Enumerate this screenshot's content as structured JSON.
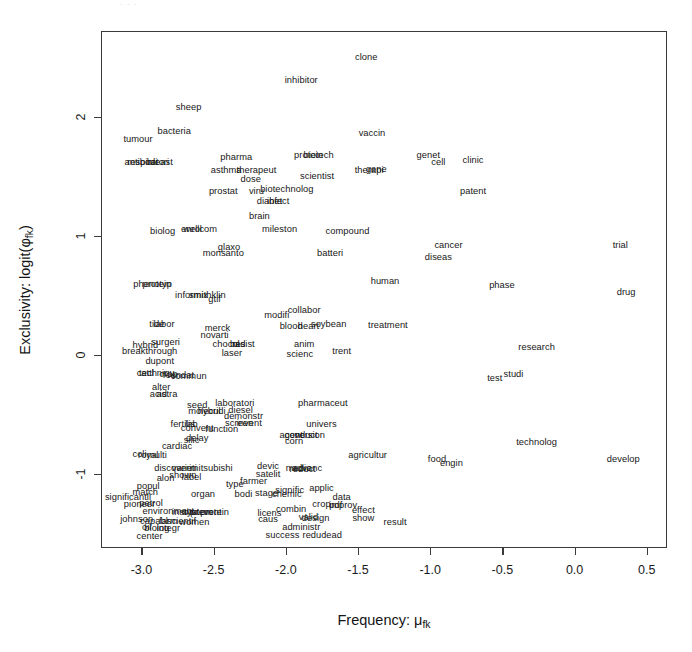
{
  "figure": {
    "top_artifact_text": "· ·                                                    ·"
  },
  "chart_data": {
    "type": "scatter",
    "title": "",
    "subtitle": "",
    "xlabel": "Frequency: μ_fk",
    "ylabel": "Exclusivity: logit(φ_fk)",
    "xlabel_parts": {
      "text": "Frequency: μ",
      "sub": "fk"
    },
    "ylabel_parts": {
      "pre": "Exclusivity: logit(φ",
      "sub": "fk",
      "post": ")"
    },
    "grid": false,
    "legend": null,
    "xlim": [
      -3.28,
      0.64
    ],
    "ylim": [
      -1.62,
      2.72
    ],
    "xticks": [
      -3.0,
      -2.5,
      -2.0,
      -1.5,
      -1.0,
      -0.5,
      0.0,
      0.5
    ],
    "xticklabels": [
      "-3.0",
      "-2.5",
      "-2.0",
      "-1.5",
      "-1.0",
      "-0.5",
      "0.0",
      "0.5"
    ],
    "yticks": [
      -1,
      0,
      1,
      2
    ],
    "yticklabels": [
      "-1",
      "0",
      "1",
      "2"
    ],
    "marker": "text-label",
    "note": "Each data point is rendered as its word label (STM topic word plot).",
    "points": [
      {
        "label": "clone",
        "x": -1.45,
        "y": 2.5
      },
      {
        "label": "inhibitor",
        "x": -1.9,
        "y": 2.31
      },
      {
        "label": "sheep",
        "x": -2.68,
        "y": 2.08
      },
      {
        "label": "bacteria",
        "x": -2.78,
        "y": 1.88
      },
      {
        "label": "tumour",
        "x": -3.03,
        "y": 1.81
      },
      {
        "label": "vaccin",
        "x": -1.41,
        "y": 1.86
      },
      {
        "label": "antibodi",
        "x": -3.01,
        "y": 1.62
      },
      {
        "label": "respiratori",
        "x": -2.96,
        "y": 1.62
      },
      {
        "label": "breast",
        "x": -2.88,
        "y": 1.62
      },
      {
        "label": "pharma",
        "x": -2.35,
        "y": 1.66
      },
      {
        "label": "protein",
        "x": -1.85,
        "y": 1.68
      },
      {
        "label": "biotech",
        "x": -1.78,
        "y": 1.68
      },
      {
        "label": "asthma",
        "x": -2.42,
        "y": 1.55
      },
      {
        "label": "therapeut",
        "x": -2.21,
        "y": 1.55
      },
      {
        "label": "therapi",
        "x": -1.43,
        "y": 1.55
      },
      {
        "label": "gene",
        "x": -1.38,
        "y": 1.56
      },
      {
        "label": "genet",
        "x": -1.02,
        "y": 1.68
      },
      {
        "label": "cell",
        "x": -0.95,
        "y": 1.62
      },
      {
        "label": "clinic",
        "x": -0.71,
        "y": 1.64
      },
      {
        "label": "dose",
        "x": -2.25,
        "y": 1.48
      },
      {
        "label": "scientist",
        "x": -1.79,
        "y": 1.5
      },
      {
        "label": "prostat",
        "x": -2.44,
        "y": 1.38
      },
      {
        "label": "viru",
        "x": -2.21,
        "y": 1.38
      },
      {
        "label": "biotechnolog",
        "x": -2.0,
        "y": 1.39
      },
      {
        "label": "patent",
        "x": -0.71,
        "y": 1.38
      },
      {
        "label": "diabet",
        "x": -2.12,
        "y": 1.29
      },
      {
        "label": "infect",
        "x": -2.06,
        "y": 1.29
      },
      {
        "label": "brain",
        "x": -2.19,
        "y": 1.17
      },
      {
        "label": "biolog",
        "x": -2.86,
        "y": 1.04
      },
      {
        "label": "enrol",
        "x": -2.66,
        "y": 1.06
      },
      {
        "label": "wellcom",
        "x": -2.6,
        "y": 1.06
      },
      {
        "label": "mileston",
        "x": -2.05,
        "y": 1.06
      },
      {
        "label": "compound",
        "x": -1.58,
        "y": 1.04
      },
      {
        "label": "cancer",
        "x": -0.88,
        "y": 0.92
      },
      {
        "label": "trial",
        "x": 0.31,
        "y": 0.92
      },
      {
        "label": "glaxo",
        "x": -2.4,
        "y": 0.91
      },
      {
        "label": "monsanto",
        "x": -2.44,
        "y": 0.86
      },
      {
        "label": "batteri",
        "x": -1.7,
        "y": 0.86
      },
      {
        "label": "diseas",
        "x": -0.95,
        "y": 0.82
      },
      {
        "label": "phenotyp",
        "x": -2.93,
        "y": 0.6
      },
      {
        "label": "protein2",
        "x": -2.9,
        "y": 0.6,
        "display": "protein"
      },
      {
        "label": "human",
        "x": -1.32,
        "y": 0.62
      },
      {
        "label": "phase",
        "x": -0.51,
        "y": 0.59
      },
      {
        "label": "drug",
        "x": 0.35,
        "y": 0.53
      },
      {
        "label": "informix",
        "x": -2.66,
        "y": 0.5
      },
      {
        "label": "smithklin",
        "x": -2.55,
        "y": 0.5
      },
      {
        "label": "gtif",
        "x": -2.5,
        "y": 0.47
      },
      {
        "label": "modifi",
        "x": -2.07,
        "y": 0.34
      },
      {
        "label": "collabor",
        "x": -1.88,
        "y": 0.38
      },
      {
        "label": "tide",
        "x": -2.9,
        "y": 0.26
      },
      {
        "label": "labor",
        "x": -2.85,
        "y": 0.26
      },
      {
        "label": "merck",
        "x": -2.48,
        "y": 0.23
      },
      {
        "label": "blood",
        "x": -1.97,
        "y": 0.24
      },
      {
        "label": "heart",
        "x": -1.85,
        "y": 0.24
      },
      {
        "label": "soybean",
        "x": -1.71,
        "y": 0.26
      },
      {
        "label": "treatment",
        "x": -1.3,
        "y": 0.25
      },
      {
        "label": "novarti",
        "x": -2.5,
        "y": 0.17
      },
      {
        "label": "hybrid",
        "x": -2.98,
        "y": 0.08
      },
      {
        "label": "surgeri",
        "x": -2.84,
        "y": 0.11
      },
      {
        "label": "chocol",
        "x": -2.42,
        "y": 0.09
      },
      {
        "label": "bad",
        "x": -2.34,
        "y": 0.09
      },
      {
        "label": "resist",
        "x": -2.3,
        "y": 0.09
      },
      {
        "label": "anim",
        "x": -1.88,
        "y": 0.09
      },
      {
        "label": "research",
        "x": -0.27,
        "y": 0.07
      },
      {
        "label": "breakthrough",
        "x": -2.95,
        "y": 0.03
      },
      {
        "label": "laser",
        "x": -2.38,
        "y": 0.02
      },
      {
        "label": "scienc",
        "x": -1.91,
        "y": 0.01
      },
      {
        "label": "trent",
        "x": -1.62,
        "y": 0.03
      },
      {
        "label": "dupont",
        "x": -2.88,
        "y": -0.05
      },
      {
        "label": "cattl",
        "x": -2.98,
        "y": -0.15
      },
      {
        "label": "techniqu",
        "x": -2.9,
        "y": -0.15
      },
      {
        "label": "crop2",
        "x": -2.82,
        "y": -0.16,
        "display": "crop"
      },
      {
        "label": "foundat",
        "x": -2.75,
        "y": -0.17
      },
      {
        "label": "commun",
        "x": -2.68,
        "y": -0.18
      },
      {
        "label": "test",
        "x": -0.56,
        "y": -0.19
      },
      {
        "label": "studi",
        "x": -0.43,
        "y": -0.16
      },
      {
        "label": "alter",
        "x": -2.87,
        "y": -0.27
      },
      {
        "label": "acid",
        "x": -2.89,
        "y": -0.33
      },
      {
        "label": "astra",
        "x": -2.83,
        "y": -0.33
      },
      {
        "label": "seed",
        "x": -2.62,
        "y": -0.42
      },
      {
        "label": "laboratori",
        "x": -2.36,
        "y": -0.4
      },
      {
        "label": "pharmaceut",
        "x": -1.75,
        "y": -0.4
      },
      {
        "label": "molecul",
        "x": -2.57,
        "y": -0.47
      },
      {
        "label": "hybridi",
        "x": -2.52,
        "y": -0.47
      },
      {
        "label": "diesel",
        "x": -2.32,
        "y": -0.46
      },
      {
        "label": "demonstr",
        "x": -2.3,
        "y": -0.51
      },
      {
        "label": "fertilis",
        "x": -2.72,
        "y": -0.58
      },
      {
        "label": "lab",
        "x": -2.66,
        "y": -0.58
      },
      {
        "label": "convent",
        "x": -2.62,
        "y": -0.61
      },
      {
        "label": "screen",
        "x": -2.33,
        "y": -0.57
      },
      {
        "label": "invent",
        "x": -2.26,
        "y": -0.57
      },
      {
        "label": "univers",
        "x": -1.76,
        "y": -0.58
      },
      {
        "label": "function",
        "x": -2.45,
        "y": -0.62
      },
      {
        "label": "agent",
        "x": -1.97,
        "y": -0.67
      },
      {
        "label": "conduct",
        "x": -1.9,
        "y": -0.67
      },
      {
        "label": "version",
        "x": -1.84,
        "y": -0.67
      },
      {
        "label": "delay",
        "x": -2.62,
        "y": -0.7
      },
      {
        "label": "silic",
        "x": -2.66,
        "y": -0.71
      },
      {
        "label": "cardiac",
        "x": -2.76,
        "y": -0.76
      },
      {
        "label": "corn",
        "x": -1.95,
        "y": -0.72
      },
      {
        "label": "technolog",
        "x": -0.27,
        "y": -0.73
      },
      {
        "label": "coli",
        "x": -3.02,
        "y": -0.83
      },
      {
        "label": "royal",
        "x": -2.96,
        "y": -0.84
      },
      {
        "label": "multi",
        "x": -2.9,
        "y": -0.84
      },
      {
        "label": "agricultur",
        "x": -1.44,
        "y": -0.84
      },
      {
        "label": "food",
        "x": -0.96,
        "y": -0.87
      },
      {
        "label": "engin",
        "x": -0.86,
        "y": -0.91
      },
      {
        "label": "develop",
        "x": 0.33,
        "y": -0.87
      },
      {
        "label": "discoveri",
        "x": -2.79,
        "y": -0.95
      },
      {
        "label": "varieti",
        "x": -2.71,
        "y": -0.95
      },
      {
        "label": "mitsubishi",
        "x": -2.52,
        "y": -0.95
      },
      {
        "label": "devic",
        "x": -2.13,
        "y": -0.93
      },
      {
        "label": "medic",
        "x": -1.92,
        "y": -0.95
      },
      {
        "label": "advanc",
        "x": -1.86,
        "y": -0.95
      },
      {
        "label": "reduct",
        "x": -1.89,
        "y": -0.96
      },
      {
        "label": "shown",
        "x": -2.72,
        "y": -1.01
      },
      {
        "label": "label",
        "x": -2.66,
        "y": -1.02
      },
      {
        "label": "satelit",
        "x": -2.13,
        "y": -1.0
      },
      {
        "label": "alon",
        "x": -2.84,
        "y": -1.03
      },
      {
        "label": "farmer",
        "x": -2.23,
        "y": -1.06
      },
      {
        "label": "popul",
        "x": -2.96,
        "y": -1.1
      },
      {
        "label": "type",
        "x": -2.36,
        "y": -1.08
      },
      {
        "label": "match",
        "x": -2.98,
        "y": -1.15
      },
      {
        "label": "organ",
        "x": -2.58,
        "y": -1.17
      },
      {
        "label": "bodi",
        "x": -2.3,
        "y": -1.17
      },
      {
        "label": "stage",
        "x": -2.14,
        "y": -1.16
      },
      {
        "label": "signific",
        "x": -1.98,
        "y": -1.13
      },
      {
        "label": "applic",
        "x": -1.76,
        "y": -1.12
      },
      {
        "label": "chemic",
        "x": -2.0,
        "y": -1.17
      },
      {
        "label": "significantli",
        "x": -3.1,
        "y": -1.19
      },
      {
        "label": "data",
        "x": -1.62,
        "y": -1.19
      },
      {
        "label": "pioneer",
        "x": -3.02,
        "y": -1.25
      },
      {
        "label": "petrol",
        "x": -2.94,
        "y": -1.24
      },
      {
        "label": "crop",
        "x": -1.76,
        "y": -1.25
      },
      {
        "label": "pdf",
        "x": -1.66,
        "y": -1.26
      },
      {
        "label": "improv2",
        "x": -1.61,
        "y": -1.26,
        "display": "improv"
      },
      {
        "label": "environment",
        "x": -2.82,
        "y": -1.31
      },
      {
        "label": "institut",
        "x": -2.7,
        "y": -1.32
      },
      {
        "label": "system",
        "x": -2.62,
        "y": -1.32
      },
      {
        "label": "prevent",
        "x": -2.56,
        "y": -1.32
      },
      {
        "label": "protein3",
        "x": -2.5,
        "y": -1.32,
        "display": "protein"
      },
      {
        "label": "licens",
        "x": -2.12,
        "y": -1.33
      },
      {
        "label": "combin",
        "x": -1.97,
        "y": -1.29
      },
      {
        "label": "effect",
        "x": -1.47,
        "y": -1.3
      },
      {
        "label": "johnson",
        "x": -3.04,
        "y": -1.38
      },
      {
        "label": "capabl",
        "x": -2.92,
        "y": -1.39
      },
      {
        "label": "farm",
        "x": -2.82,
        "y": -1.39
      },
      {
        "label": "scientif",
        "x": -2.73,
        "y": -1.39
      },
      {
        "label": "women",
        "x": -2.64,
        "y": -1.4
      },
      {
        "label": "caus",
        "x": -2.13,
        "y": -1.38
      },
      {
        "label": "valid",
        "x": -1.85,
        "y": -1.36
      },
      {
        "label": "design",
        "x": -1.8,
        "y": -1.37
      },
      {
        "label": "show",
        "x": -1.47,
        "y": -1.37
      },
      {
        "label": "result",
        "x": -1.25,
        "y": -1.4
      },
      {
        "label": "oil",
        "x": -2.97,
        "y": -1.44
      },
      {
        "label": "biolog2",
        "x": -2.9,
        "y": -1.45,
        "display": "biolog"
      },
      {
        "label": "integr",
        "x": -2.82,
        "y": -1.45
      },
      {
        "label": "administr",
        "x": -1.9,
        "y": -1.44
      },
      {
        "label": "center",
        "x": -2.95,
        "y": -1.52
      },
      {
        "label": "success",
        "x": -2.03,
        "y": -1.51
      },
      {
        "label": "reduc",
        "x": -1.81,
        "y": -1.51
      },
      {
        "label": "lead",
        "x": -1.68,
        "y": -1.51
      }
    ]
  }
}
